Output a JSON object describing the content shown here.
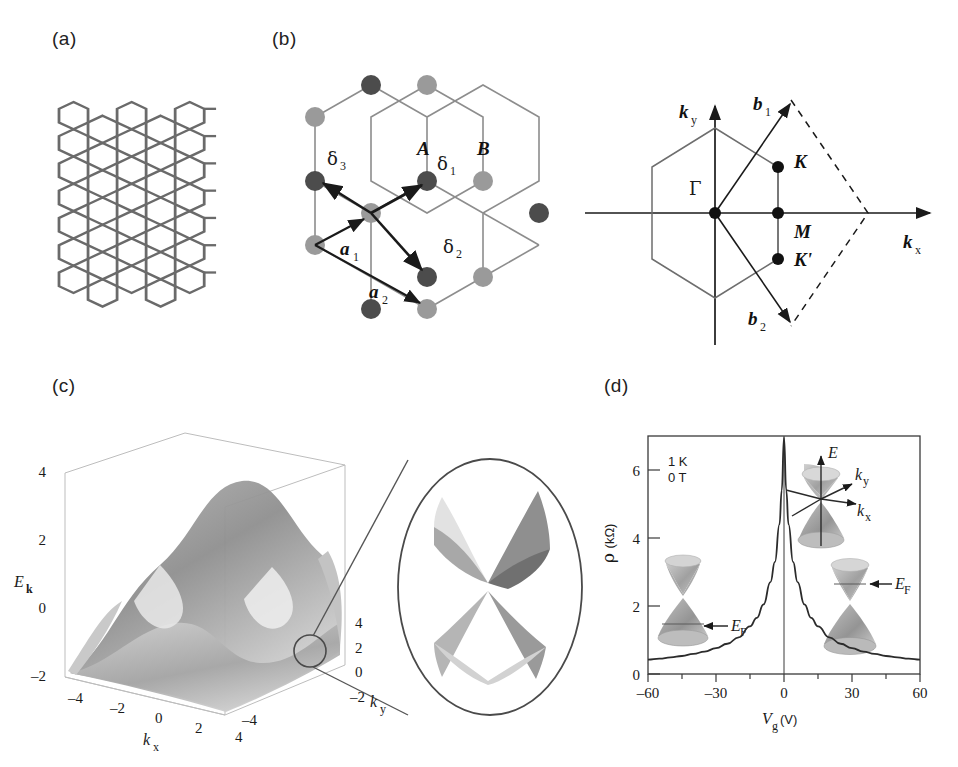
{
  "figure": {
    "panels": [
      {
        "id": "a",
        "label": "(a)",
        "caption": "graphene honeycomb lattice sheet"
      },
      {
        "id": "b",
        "label": "(b)",
        "caption": "honeycomb lattice vectors and Brillouin zone"
      },
      {
        "id": "c",
        "label": "(c)",
        "caption": "electronic band structure of graphene"
      },
      {
        "id": "d",
        "label": "(d)",
        "caption": "resistivity versus gate voltage"
      }
    ]
  },
  "panel_a": {
    "label": "(a)",
    "lattice": {
      "rows": 7,
      "cols": 5,
      "bond_color": "#6a6a6a",
      "atom_color": "#5a5a5a"
    }
  },
  "panel_b": {
    "label": "(b)",
    "sublattice_labels": [
      "A",
      "B"
    ],
    "delta_vectors": [
      "δ 1",
      "δ 2",
      "δ 3"
    ],
    "delta_1": "δ",
    "delta_1_sub": "1",
    "delta_2": "δ",
    "delta_2_sub": "2",
    "delta_3": "δ",
    "delta_3_sub": "3",
    "lattice_vectors": [
      "a",
      "a"
    ],
    "a1": "a",
    "a1_sub": "1",
    "a2": "a",
    "a2_sub": "2",
    "atom_colors": {
      "A": "#4c4c4c",
      "B": "#9a9a9a"
    }
  },
  "panel_bz": {
    "axis_x": "k",
    "axis_x_sub": "x",
    "axis_y": "k",
    "axis_y_sub": "y",
    "b1": "b",
    "b1_sub": "1",
    "b2": "b",
    "b2_sub": "2",
    "gamma": "Γ",
    "points": [
      "K",
      "M",
      "K'"
    ],
    "K": "K",
    "M": "M",
    "Kprime": "K'"
  },
  "panel_c": {
    "label": "(c)",
    "axis_energy": "E",
    "axis_energy_sub": "k",
    "axis_kx": "k",
    "axis_kx_sub": "x",
    "axis_ky": "k",
    "axis_ky_sub": "y",
    "energy_ticks": [
      "4",
      "2",
      "0",
      "–2"
    ],
    "kx_ticks": [
      "–4",
      "–2",
      "0",
      "2",
      "4"
    ],
    "ky_ticks": [
      "4",
      "2",
      "0",
      "–2",
      "–4"
    ],
    "zoom_caption": "Dirac cone magnification"
  },
  "panel_d": {
    "label": "(d)",
    "annotations": [
      "1 K",
      "0 T"
    ],
    "temperature": "1 K",
    "field": "0 T",
    "ylabel": "ρ",
    "ylabel_unit": "(kΩ)",
    "xlabel": "V",
    "xlabel_sub": "g",
    "xlabel_unit": "(V)",
    "fermi_label": "E",
    "fermi_sub": "F",
    "cone_axes": {
      "E": "E",
      "kx": "k",
      "kx_sub": "x",
      "ky": "k",
      "ky_sub": "y"
    }
  },
  "chart_data": [
    {
      "type": "line",
      "panel": "c",
      "title": "Graphene tight-binding band structure",
      "xlabel": "k_x",
      "ylabel": "k_y",
      "zlabel": "E_k",
      "xlim": [
        -4,
        4
      ],
      "ylim": [
        -4,
        4
      ],
      "zlim": [
        -2,
        4
      ],
      "xticks": [
        -4,
        -2,
        0,
        2,
        4
      ],
      "yticks": [
        -4,
        -2,
        0,
        2,
        4
      ],
      "zticks": [
        -2,
        0,
        2,
        4
      ],
      "grid": false,
      "legend": "none",
      "note": "3D surface, conduction and valence bands touching at Dirac points"
    },
    {
      "type": "line",
      "panel": "d",
      "title": "Resistivity vs gate voltage",
      "xlabel": "Vg (V)",
      "ylabel": "rho (kOhm)",
      "xlim": [
        -60,
        60
      ],
      "ylim": [
        0,
        7
      ],
      "xticks": [
        -60,
        -30,
        0,
        30,
        60
      ],
      "yticks": [
        0,
        2,
        4,
        6
      ],
      "grid": false,
      "legend": "none",
      "annotations": [
        "1 K",
        "0 T"
      ],
      "x": [
        -60,
        -55,
        -50,
        -45,
        -40,
        -35,
        -30,
        -25,
        -20,
        -15,
        -12,
        -9,
        -6,
        -4,
        -2,
        -1,
        0,
        1,
        2,
        4,
        6,
        9,
        12,
        15,
        20,
        25,
        30,
        35,
        40,
        45,
        50,
        55,
        60
      ],
      "values": [
        0.42,
        0.45,
        0.49,
        0.53,
        0.59,
        0.66,
        0.76,
        0.89,
        1.08,
        1.4,
        1.65,
        2.05,
        2.7,
        3.3,
        4.4,
        5.4,
        6.95,
        5.4,
        4.4,
        3.3,
        2.7,
        2.05,
        1.65,
        1.4,
        1.08,
        0.89,
        0.76,
        0.66,
        0.59,
        0.53,
        0.49,
        0.45,
        0.42
      ]
    }
  ]
}
